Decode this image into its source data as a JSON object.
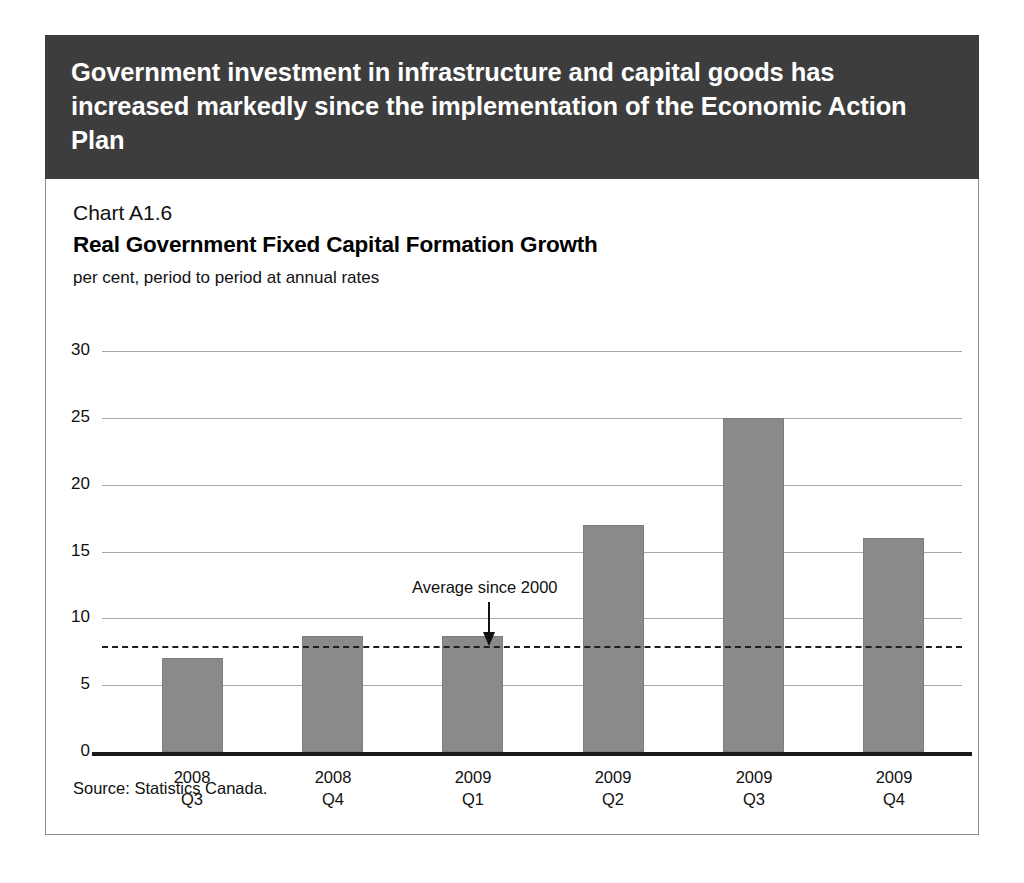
{
  "banner": {
    "text": "Government investment in infrastructure and capital goods has increased markedly since the implementation of the Economic Action Plan"
  },
  "chart_number": "Chart A1.6",
  "source": "Source: Statistics Canada.",
  "chart_data": {
    "type": "bar",
    "title": "Real Government Fixed Capital Formation Growth",
    "subtitle": "per cent, period to period at annual rates",
    "xlabel": "",
    "ylabel": "",
    "ylim": [
      0,
      30
    ],
    "yticks": [
      0,
      5,
      10,
      15,
      20,
      25,
      30
    ],
    "ytick_labels": [
      "0",
      "5",
      "10",
      "15",
      "20",
      "25",
      "30"
    ],
    "grid": true,
    "legend": "none",
    "categories": [
      "2008\nQ3",
      "2008\nQ4",
      "2009\nQ1",
      "2009\nQ2",
      "2009\nQ3",
      "2009\nQ4"
    ],
    "category_lines": [
      [
        "2008",
        "Q3"
      ],
      [
        "2008",
        "Q4"
      ],
      [
        "2009",
        "Q1"
      ],
      [
        "2009",
        "Q2"
      ],
      [
        "2009",
        "Q3"
      ],
      [
        "2009",
        "Q4"
      ]
    ],
    "values": [
      7.0,
      8.7,
      8.7,
      17.0,
      25.0,
      16.0
    ],
    "bar_color": "#8a8a8a",
    "annotations": [
      {
        "text": "Average since 2000",
        "type": "reference-line",
        "value": 7.9,
        "style": "dashed",
        "color": "#1f1f1f"
      }
    ]
  },
  "colors": {
    "banner_background": "#3d3d3d",
    "banner_text": "#ffffff",
    "bar_fill": "#8a8a8a",
    "gridline": "#a8a8a8",
    "axis": "#1a1a1a",
    "panel_border": "#8c8c8c"
  }
}
